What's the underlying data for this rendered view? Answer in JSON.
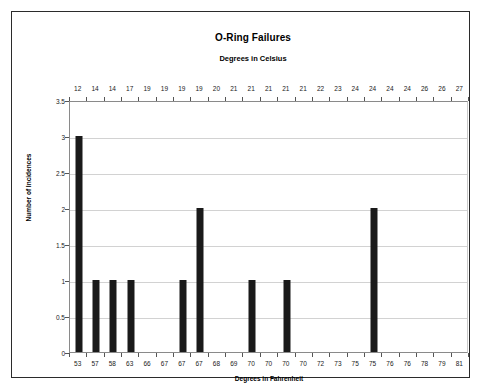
{
  "chart_data": {
    "type": "bar",
    "title": "O-Ring Failures",
    "subtitle": "Degrees in Celsius",
    "xlabel": "Degrees in Fahrenheit",
    "ylabel": "Number of Incidences",
    "top_axis_label": "Degrees in Celsius",
    "categories": [
      "53",
      "57",
      "58",
      "63",
      "66",
      "67",
      "67",
      "67",
      "68",
      "69",
      "70",
      "70",
      "70",
      "70",
      "72",
      "73",
      "75",
      "75",
      "76",
      "76",
      "78",
      "79",
      "81"
    ],
    "secondary_categories": [
      "12",
      "14",
      "14",
      "17",
      "19",
      "19",
      "19",
      "19",
      "20",
      "21",
      "21",
      "21",
      "21",
      "21",
      "22",
      "23",
      "24",
      "24",
      "24",
      "24",
      "26",
      "26",
      "27"
    ],
    "values": [
      3,
      1,
      1,
      1,
      0,
      0,
      1,
      2,
      0,
      0,
      1,
      0,
      1,
      0,
      0,
      0,
      0,
      2,
      0,
      0,
      0,
      0,
      0
    ],
    "ylim": [
      0,
      3.5
    ],
    "yticks": [
      "0",
      "0.5",
      "1",
      "1.5",
      "2",
      "2.5",
      "3",
      "3.5"
    ],
    "ytick_values": [
      0,
      0.5,
      1,
      1.5,
      2,
      2.5,
      3,
      3.5
    ],
    "grid": true,
    "legend": false,
    "bar_color": "#1a1a1a",
    "gridline_color": "#d2d2d2",
    "axis_color": "#8a8a8a"
  }
}
